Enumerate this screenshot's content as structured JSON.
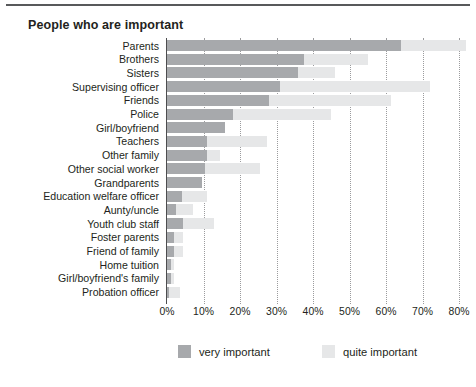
{
  "figure": {
    "title": "People who are important",
    "top_rule": true
  },
  "chart_data": {
    "type": "bar",
    "orientation": "horizontal",
    "stacked": true,
    "title": "People who are important",
    "xlabel": "",
    "ylabel": "",
    "xlim": [
      0,
      80
    ],
    "xunit": "%",
    "grid": "vertical-dotted",
    "legend_position": "bottom",
    "colors": {
      "very important": "#a7a9ac",
      "quite important": "#e6e7e8",
      "axis": "#4d4d4f",
      "grid": "#9b9b9d",
      "text": "#231f20"
    },
    "xticks": [
      "0%",
      "10%",
      "20%",
      "30%",
      "40%",
      "50%",
      "60%",
      "70%",
      "80%"
    ],
    "xtick_values": [
      0,
      10,
      20,
      30,
      40,
      50,
      60,
      70,
      80
    ],
    "categories": [
      "Parents",
      "Brothers",
      "Sisters",
      "Supervising officer",
      "Friends",
      "Police",
      "Girl/boyfriend",
      "Teachers",
      "Other family",
      "Other social worker",
      "Grandparents",
      "Education welfare officer",
      "Aunty/uncle",
      "Youth club staff",
      "Foster parents",
      "Friend of family",
      "Home tuition",
      "Girl/boyfriend's family",
      "Probation officer"
    ],
    "series": [
      {
        "name": "very important",
        "color": "#a7a9ac",
        "values": [
          64,
          37.5,
          36,
          31,
          28,
          18,
          16,
          11,
          11,
          10.5,
          9.5,
          4,
          2.5,
          4.5,
          2,
          2,
          1,
          1,
          0.5
        ]
      },
      {
        "name": "quite important",
        "color": "#e6e7e8",
        "values": [
          18,
          17.5,
          10,
          41,
          33.5,
          27,
          0,
          16.5,
          3.5,
          15,
          0,
          7,
          4.5,
          8.5,
          2.5,
          2.5,
          1,
          1,
          3
        ]
      }
    ],
    "totals": [
      82,
      55,
      46,
      72,
      61.5,
      45,
      16,
      27.5,
      14.5,
      25.5,
      9.5,
      11,
      7,
      13,
      4.5,
      4.5,
      2,
      2,
      3.5
    ]
  },
  "legend": {
    "items": [
      {
        "label": "very important",
        "color": "#a7a9ac"
      },
      {
        "label": "quite important",
        "color": "#e6e7e8"
      }
    ]
  }
}
